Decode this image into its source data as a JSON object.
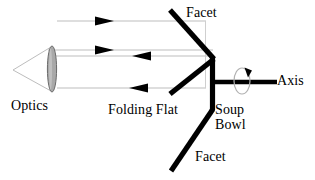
{
  "diagram": {
    "canvas": {
      "width": 315,
      "height": 180,
      "background": "#ffffff"
    },
    "colors": {
      "ray": "#b8b8b8",
      "lens_fill": "#a8a8a8",
      "lens_stroke": "#6e6e6e",
      "mirror": "#000000",
      "axis": "#000000",
      "arrow": "#000000",
      "rotation_ring": "#b0b0b0",
      "text": "#000000"
    },
    "labels": {
      "facet_top": "Facet",
      "optics": "Optics",
      "folding_flat": "Folding Flat",
      "soup_bowl_line1": "Soup",
      "soup_bowl_line2": "Bowl",
      "axis": "Axis",
      "facet_bottom": "Facet"
    },
    "geometry": {
      "lens": {
        "cx": 52,
        "cy": 69,
        "rx": 4.5,
        "ry": 23
      },
      "cone_apex": {
        "x": 13,
        "y": 70
      },
      "rays": [
        {
          "name": "upper-ray",
          "x1": 57,
          "y1": 21,
          "x2": 205,
          "y2": 21
        },
        {
          "name": "middle-ray-outgoing",
          "x1": 48,
          "y1": 50,
          "x2": 212,
          "y2": 50
        },
        {
          "name": "middle-ray-returning",
          "x1": 48,
          "y1": 56,
          "x2": 212,
          "y2": 56
        },
        {
          "name": "lower-ray",
          "x1": 57,
          "y1": 88,
          "x2": 205,
          "y2": 88
        },
        {
          "name": "vertical-connector-right",
          "x1": 205,
          "y1": 21,
          "x2": 205,
          "y2": 88
        }
      ],
      "arrowheads": [
        {
          "name": "upper-ray-arrow",
          "x": 107,
          "y": 21,
          "direction": "right"
        },
        {
          "name": "middle-ray-arrow-right",
          "x": 107,
          "y": 50,
          "direction": "right"
        },
        {
          "name": "middle-ray-arrow-left",
          "x": 143,
          "y": 56,
          "direction": "left"
        },
        {
          "name": "lower-ray-arrow-left",
          "x": 140,
          "y": 88,
          "direction": "left"
        }
      ],
      "mirrors": [
        {
          "name": "facet-top-mirror",
          "x1": 171,
          "y1": 11,
          "x2": 213,
          "y2": 59
        },
        {
          "name": "folding-flat-mirror",
          "x1": 213,
          "y1": 59,
          "x2": 171,
          "y2": 93
        },
        {
          "name": "soup-bowl-vertical",
          "x1": 213,
          "y1": 59,
          "x2": 213,
          "y2": 110
        },
        {
          "name": "facet-bottom-mirror",
          "x1": 213,
          "y1": 110,
          "x2": 172,
          "y2": 170
        }
      ],
      "axis_line": {
        "x1": 213,
        "y1": 82,
        "x2": 277,
        "y2": 82
      },
      "rotation_ring": {
        "cx": 242,
        "cy": 81,
        "rx": 8,
        "ry": 13
      },
      "rotation_arrow": {
        "x": 248,
        "y": 70,
        "direction": "clockwise"
      }
    }
  }
}
